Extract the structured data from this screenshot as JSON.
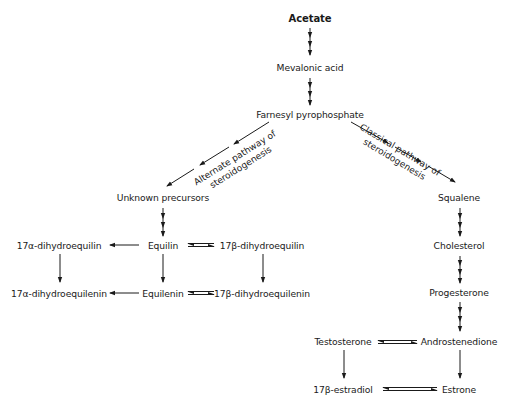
{
  "diagram": {
    "title_node": "Acetate",
    "nodes": {
      "acetate": "Acetate",
      "mevalonic": "Mevalonic acid",
      "farnesyl": "Farnesyl pyrophosphate",
      "unknown": "Unknown precursors",
      "squalene": "Squalene",
      "cholesterol": "Cholesterol",
      "progesterone": "Progesterone",
      "equilin": "Equilin",
      "a_dihydroequilin": "17α-dihydroequilin",
      "b_dihydroequilin": "17β-dihydroequilin",
      "equilenin": "Equilenin",
      "a_dihydroequilenin": "17α-dihydroequilenin",
      "b_dihydroequilenin": "17β-dihydroequilenin",
      "testosterone": "Testosterone",
      "androstenedione": "Androstenedione",
      "estradiol": "17β-estradiol",
      "estrone": "Estrone"
    },
    "pathway_labels": {
      "alternate_line1": "Alternate pathway of",
      "alternate_line2": "steroidogenesis",
      "classical_line1": "Classical pathway of",
      "classical_line2": "steroidogenesis"
    },
    "colors": {
      "line": "#1a1a1a",
      "background": "#ffffff"
    }
  }
}
